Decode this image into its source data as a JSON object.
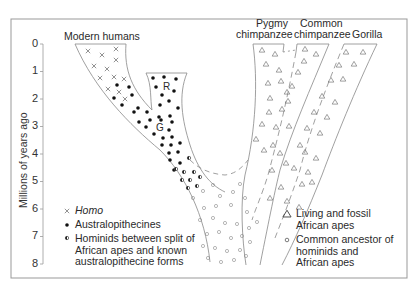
{
  "diagram": {
    "y_axis": {
      "label": "Millions of years ago",
      "ticks": [
        "0",
        "1",
        "2",
        "3",
        "4",
        "5",
        "6",
        "7",
        "8"
      ]
    },
    "branch_labels": {
      "modern_humans": "Modern humans",
      "pygmy_chimpanzee_line1": "Pygmy",
      "pygmy_chimpanzee_line2": "chimpanzee",
      "common_chimpanzee_line1": "Common",
      "common_chimpanzee_line2": "chimpanzee",
      "gorilla": "Gorilla",
      "robust_marker": "R",
      "gracile_marker": "G"
    },
    "legend_left": [
      {
        "symbol": "cross",
        "label": "Homo"
      },
      {
        "symbol": "filled-dot",
        "label": "Australopithecines"
      },
      {
        "symbol": "half-filled-dot",
        "label_line1": "Hominids between split of",
        "label_line2": "African apes and known",
        "label_line3": "australopithecine forms"
      }
    ],
    "legend_right": [
      {
        "symbol": "triangle",
        "label_line1": "Living and fossil",
        "label_line2": "African apes"
      },
      {
        "symbol": "open-circle",
        "label_line1": "Common ancestor of",
        "label_line2": "hominids and",
        "label_line3": "African apes"
      }
    ]
  }
}
